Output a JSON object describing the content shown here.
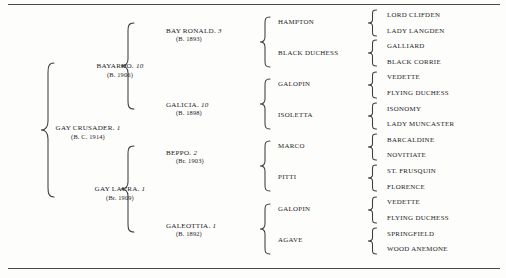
{
  "document": {
    "type": "pedigree-chart",
    "subject": "GAY CRUSADER",
    "rules": {
      "top_label": "top-rule",
      "bottom_label": "bottom-rule"
    }
  },
  "generations": {
    "g0": [
      {
        "name": "GAY CRUSADER.",
        "rank": "1",
        "year": "(B. C. 1914)"
      }
    ],
    "g1": [
      {
        "name": "BAYARDO.",
        "rank": "10",
        "year": "(B. 1906)"
      },
      {
        "name": "GAY LAURA.",
        "rank": "1",
        "year": "(Br. 1909)"
      }
    ],
    "g2": [
      {
        "name": "BAY RONALD.",
        "rank": "3",
        "year": "(B. 1893)"
      },
      {
        "name": "GALICIA.",
        "rank": "10",
        "year": "(B. 1898)"
      },
      {
        "name": "BEPPO.",
        "rank": "2",
        "year": "(Br. 1903)"
      },
      {
        "name": "GALEOTTIA.",
        "rank": "1",
        "year": "(B. 1892)"
      }
    ],
    "g3": [
      {
        "name": "HAMPTON"
      },
      {
        "name": "BLACK DUCHESS"
      },
      {
        "name": "GALOPIN"
      },
      {
        "name": "ISOLETTA"
      },
      {
        "name": "MARCO"
      },
      {
        "name": "PITTI"
      },
      {
        "name": "GALOPIN"
      },
      {
        "name": "AGAVE"
      }
    ],
    "g4": [
      {
        "name": "LORD CLIFDEN"
      },
      {
        "name": "LADY LANGDEN"
      },
      {
        "name": "GALLIARD"
      },
      {
        "name": "BLACK CORRIE"
      },
      {
        "name": "VEDETTE"
      },
      {
        "name": "FLYING DUCHESS"
      },
      {
        "name": "ISONOMY"
      },
      {
        "name": "LADY MUNCASTER"
      },
      {
        "name": "BARCALDINE"
      },
      {
        "name": "NOVITIATE"
      },
      {
        "name": "ST. FRUSQUIN"
      },
      {
        "name": "FLORENCE"
      },
      {
        "name": "VEDETTE"
      },
      {
        "name": "FLYING DUCHESS"
      },
      {
        "name": "SPRINGFIELD"
      },
      {
        "name": "WOOD ANEMONE"
      }
    ]
  },
  "colors": {
    "ink": "#1c1c1c",
    "rule": "#4a4a4a",
    "brace": "#3d3d3d",
    "paper": "#fdfdfc"
  }
}
